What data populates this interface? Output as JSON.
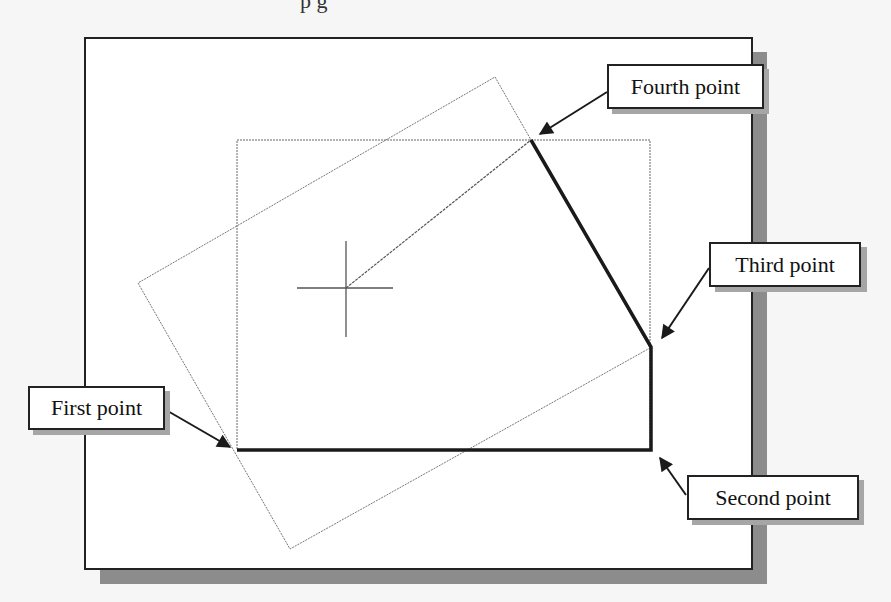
{
  "caption_top_fragment": "p                                   g",
  "diagram": {
    "labels": {
      "first": "First point",
      "second": "Second point",
      "third": "Third point",
      "fourth": "Fourth point"
    },
    "colors": {
      "frame": "#222222",
      "shadow": "#8c8c8c",
      "thin_line": "#777777",
      "thick_line": "#1a1a1a",
      "background": "#ffffff"
    }
  }
}
